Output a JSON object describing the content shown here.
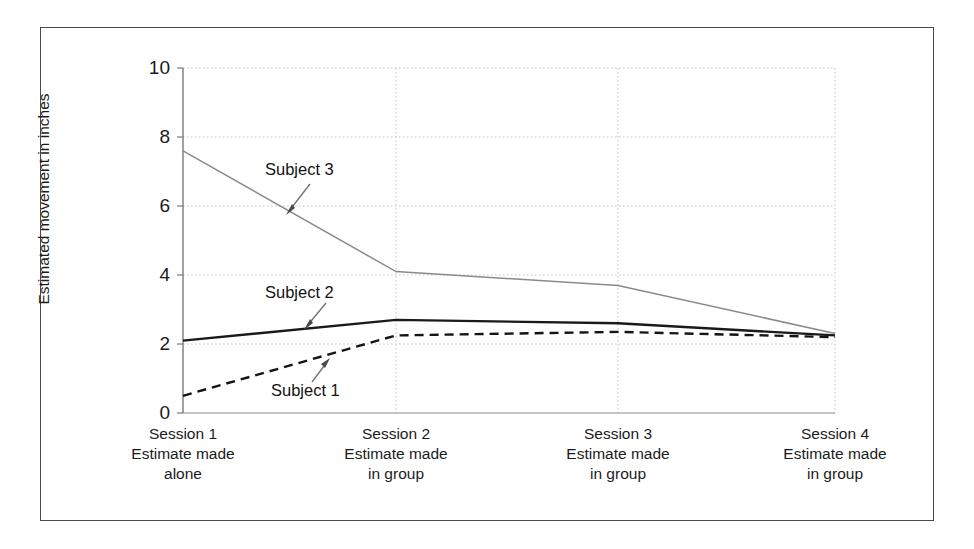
{
  "chart_data": {
    "type": "line",
    "title": "",
    "xlabel": "",
    "ylabel": "Estimated movement in inches",
    "ylim": [
      0,
      10
    ],
    "yticks": [
      0,
      2,
      4,
      6,
      8,
      10
    ],
    "grid": true,
    "legend_position": "inline-annotations",
    "categories": [
      "Session 1\nEstimate made\nalone",
      "Session 2\nEstimate made\nin group",
      "Session 3\nEstimate made\nin group",
      "Session 4\nEstimate made\nin group"
    ],
    "series": [
      {
        "name": "Subject 3",
        "values": [
          7.6,
          4.1,
          3.7,
          2.3
        ],
        "style": "thin-gray-solid"
      },
      {
        "name": "Subject 2",
        "values": [
          2.1,
          2.7,
          2.6,
          2.25
        ],
        "style": "bold-black-solid"
      },
      {
        "name": "Subject 1",
        "values": [
          0.5,
          2.25,
          2.35,
          2.2
        ],
        "style": "black-dashed"
      }
    ],
    "annotations": [
      {
        "label": "Subject 3",
        "points_to_series": "Subject 3"
      },
      {
        "label": "Subject 2",
        "points_to_series": "Subject 2"
      },
      {
        "label": "Subject 1",
        "points_to_series": "Subject 1"
      }
    ]
  },
  "axis": {
    "y_title": "Estimated movement in inches",
    "y_tick_labels": [
      "10",
      "8",
      "6",
      "4",
      "2",
      "0"
    ]
  },
  "x_categories": [
    {
      "session": "Session 1",
      "line2": "Estimate made",
      "line3": "alone"
    },
    {
      "session": "Session 2",
      "line2": "Estimate made",
      "line3": "in group"
    },
    {
      "session": "Session 3",
      "line2": "Estimate made",
      "line3": "in group"
    },
    {
      "session": "Session 4",
      "line2": "Estimate made",
      "line3": "in group"
    }
  ],
  "annotations": {
    "subject_3": "Subject 3",
    "subject_2": "Subject 2",
    "subject_1": "Subject 1"
  },
  "colors": {
    "frame": "#4a4a4a",
    "axis": "#6e6e6e",
    "grid": "#c9c9c9",
    "series_subject_3": "#8c8c8c",
    "series_subject_2": "#1a1a1a",
    "series_subject_1": "#141414",
    "text": "#1b1b1b"
  }
}
